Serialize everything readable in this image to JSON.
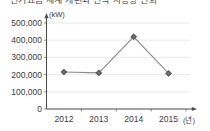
{
  "title": {
    "text": "전기요금 체계 개편과 전력 사용량 변화",
    "visible": "cropped"
  },
  "chart_data": {
    "type": "line",
    "title": "",
    "xlabel": "",
    "ylabel": "",
    "y_unit": "(kW)",
    "x_unit": "(년)",
    "categories": [
      "2012",
      "2013",
      "2014",
      "2015"
    ],
    "values": [
      215000,
      210000,
      420000,
      207000
    ],
    "series": [
      {
        "name": "전력 사용량",
        "values": [
          215000,
          210000,
          420000,
          207000
        ]
      }
    ],
    "ytick_labels": [
      "0",
      "100,000",
      "200,000",
      "300,000",
      "400,000",
      "500,000"
    ],
    "ytick_values": [
      0,
      100000,
      200000,
      300000,
      400000,
      500000
    ],
    "ylim": [
      0,
      550000
    ],
    "grid": true,
    "legend": false,
    "marker": "diamond",
    "colors": {
      "line": "#8c8c8c",
      "marker": "#59595c",
      "gridline": "#e2e2e2",
      "axis": "#4a4a4a",
      "text": "#3a3a3a",
      "background": "#ffffff"
    }
  }
}
